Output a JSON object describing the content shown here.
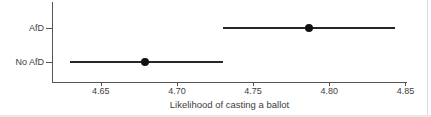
{
  "chart_data": {
    "type": "scatter",
    "subtype": "point-estimates-with-confidence-intervals",
    "orientation": "horizontal",
    "title": "",
    "xlabel": "Likelihood of casting a ballot",
    "ylabel": "",
    "categories": [
      "AfD",
      "No AfD"
    ],
    "series": [
      {
        "name": "estimate",
        "values": [
          4.787,
          4.679
        ]
      },
      {
        "name": "ci_lower",
        "values": [
          4.73,
          4.63
        ]
      },
      {
        "name": "ci_upper",
        "values": [
          4.843,
          4.73
        ]
      }
    ],
    "x_ticks": [
      4.65,
      4.7,
      4.75,
      4.8,
      4.85
    ],
    "x_tick_labels": [
      "4.65",
      "4.70",
      "4.75",
      "4.80",
      "4.85"
    ],
    "xlim": [
      4.618,
      4.851
    ],
    "grid": false,
    "legend": "none",
    "colors": {
      "interval_line": "#262626",
      "point": "#111111",
      "axis": "#555555",
      "text": "#3d3d3d"
    }
  }
}
